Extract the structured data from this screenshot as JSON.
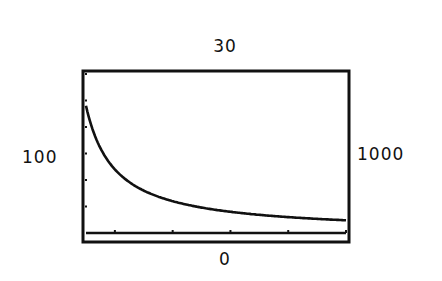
{
  "window": {
    "xmin_label": "100",
    "xmax_label": "1000",
    "ymax_label": "30",
    "ymin_label": "0"
  },
  "chart_data": {
    "type": "line",
    "title": "",
    "xlabel": "",
    "ylabel": "",
    "xlim": [
      100,
      1000
    ],
    "ylim": [
      0,
      30
    ],
    "x_tick_step": 200,
    "y_tick_step": 5,
    "grid": false,
    "legend": null,
    "annotations": [
      "Xmin = 100 (left)",
      "Xmax = 1000 (right)",
      "Ymax = 30 (top)",
      "Ymin = 0 (bottom)"
    ],
    "series": [
      {
        "name": "y1",
        "x": [
          100,
          150,
          200,
          250,
          300,
          400,
          500,
          600,
          700,
          800,
          900,
          1000
        ],
        "y": [
          24,
          16,
          12,
          9.6,
          8,
          6,
          4.8,
          4,
          3.4,
          3,
          2.7,
          2.4
        ]
      }
    ]
  }
}
